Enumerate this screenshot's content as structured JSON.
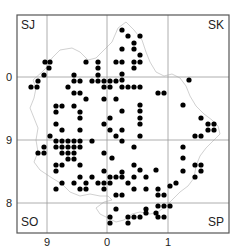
{
  "map": {
    "frame": {
      "x0": 17,
      "y0": 15,
      "x1": 229,
      "y1": 233
    },
    "colors": {
      "frame": "#555555",
      "grid": "#999999",
      "boundary": "#cccccc",
      "dot": "#000000"
    },
    "grid": {
      "vertical": [
        47,
        107,
        168
      ],
      "horizontal": [
        77,
        140,
        203
      ]
    },
    "corner_labels": {
      "top_left": "SJ",
      "top_right": "SK",
      "bottom_left": "SO",
      "bottom_right": "SP"
    },
    "y_ticks": [
      {
        "label": "0",
        "y": 77
      },
      {
        "label": "9",
        "y": 140
      },
      {
        "label": "8",
        "y": 203
      }
    ],
    "x_ticks": [
      {
        "label": "9",
        "x": 47
      },
      {
        "label": "0",
        "x": 107
      },
      {
        "label": "1",
        "x": 168
      }
    ],
    "dot_radius": 2.6,
    "dots": [
      [
        122,
        30
      ],
      [
        128,
        36
      ],
      [
        140,
        36
      ],
      [
        134,
        43
      ],
      [
        122,
        49
      ],
      [
        134,
        49
      ],
      [
        140,
        55
      ],
      [
        45,
        62
      ],
      [
        50,
        62
      ],
      [
        86,
        62
      ],
      [
        98,
        62
      ],
      [
        116,
        62
      ],
      [
        122,
        62
      ],
      [
        134,
        62
      ],
      [
        140,
        62
      ],
      [
        49,
        68
      ],
      [
        98,
        68
      ],
      [
        134,
        68
      ],
      [
        44,
        75
      ],
      [
        74,
        75
      ],
      [
        98,
        75
      ],
      [
        122,
        74
      ],
      [
        38,
        81
      ],
      [
        74,
        81
      ],
      [
        80,
        81
      ],
      [
        92,
        81
      ],
      [
        98,
        81
      ],
      [
        104,
        81
      ],
      [
        110,
        81
      ],
      [
        116,
        81
      ],
      [
        122,
        80
      ],
      [
        31,
        87
      ],
      [
        37,
        87
      ],
      [
        68,
        87
      ],
      [
        104,
        87
      ],
      [
        110,
        87
      ],
      [
        122,
        87
      ],
      [
        128,
        87
      ],
      [
        134,
        87
      ],
      [
        140,
        87
      ],
      [
        74,
        93
      ],
      [
        80,
        93
      ],
      [
        158,
        93
      ],
      [
        164,
        93
      ],
      [
        189,
        80
      ],
      [
        86,
        99
      ],
      [
        104,
        99
      ],
      [
        116,
        99
      ],
      [
        56,
        106
      ],
      [
        62,
        106
      ],
      [
        74,
        106
      ],
      [
        140,
        105
      ],
      [
        183,
        105
      ],
      [
        56,
        112
      ],
      [
        80,
        112
      ],
      [
        122,
        111
      ],
      [
        140,
        111
      ],
      [
        80,
        118
      ],
      [
        110,
        118
      ],
      [
        140,
        118
      ],
      [
        201,
        118
      ],
      [
        56,
        124
      ],
      [
        104,
        124
      ],
      [
        140,
        124
      ],
      [
        208,
        124
      ],
      [
        214,
        124
      ],
      [
        62,
        130
      ],
      [
        80,
        130
      ],
      [
        110,
        130
      ],
      [
        122,
        130
      ],
      [
        208,
        130
      ],
      [
        214,
        130
      ],
      [
        50,
        136
      ],
      [
        116,
        136
      ],
      [
        140,
        136
      ],
      [
        195,
        136
      ],
      [
        201,
        136
      ],
      [
        56,
        141
      ],
      [
        62,
        141
      ],
      [
        68,
        141
      ],
      [
        74,
        141
      ],
      [
        80,
        141
      ],
      [
        92,
        141
      ],
      [
        122,
        141
      ],
      [
        44,
        147
      ],
      [
        56,
        147
      ],
      [
        62,
        147
      ],
      [
        68,
        147
      ],
      [
        74,
        147
      ],
      [
        80,
        147
      ],
      [
        134,
        147
      ],
      [
        183,
        147
      ],
      [
        38,
        153
      ],
      [
        44,
        153
      ],
      [
        62,
        153
      ],
      [
        68,
        153
      ],
      [
        74,
        153
      ],
      [
        104,
        153
      ],
      [
        68,
        159
      ],
      [
        74,
        159
      ],
      [
        112,
        158
      ],
      [
        183,
        158
      ],
      [
        56,
        165
      ],
      [
        62,
        165
      ],
      [
        80,
        165
      ],
      [
        134,
        165
      ],
      [
        195,
        165
      ],
      [
        201,
        165
      ],
      [
        56,
        171
      ],
      [
        104,
        171
      ],
      [
        140,
        170
      ],
      [
        156,
        170
      ],
      [
        122,
        172
      ],
      [
        183,
        171
      ],
      [
        201,
        171
      ],
      [
        80,
        177
      ],
      [
        92,
        177
      ],
      [
        110,
        177
      ],
      [
        116,
        177
      ],
      [
        122,
        177
      ],
      [
        134,
        177
      ],
      [
        146,
        177
      ],
      [
        195,
        177
      ],
      [
        62,
        183
      ],
      [
        74,
        183
      ],
      [
        86,
        183
      ],
      [
        98,
        183
      ],
      [
        104,
        183
      ],
      [
        110,
        183
      ],
      [
        128,
        183
      ],
      [
        176,
        183
      ],
      [
        56,
        189
      ],
      [
        80,
        189
      ],
      [
        86,
        189
      ],
      [
        104,
        189
      ],
      [
        134,
        189
      ],
      [
        146,
        189
      ],
      [
        158,
        189
      ],
      [
        170,
        186
      ],
      [
        116,
        195
      ],
      [
        122,
        195
      ],
      [
        158,
        195
      ],
      [
        164,
        195
      ],
      [
        116,
        209
      ],
      [
        146,
        209
      ],
      [
        158,
        206
      ],
      [
        164,
        206
      ],
      [
        170,
        206
      ],
      [
        110,
        217
      ],
      [
        128,
        217
      ],
      [
        134,
        217
      ],
      [
        140,
        217
      ],
      [
        146,
        213
      ],
      [
        156,
        213
      ],
      [
        158,
        217
      ],
      [
        164,
        217
      ],
      [
        110,
        223
      ],
      [
        128,
        223
      ]
    ],
    "boundary_path": "M36,88 L33,80 L42,72 L46,68 L52,58 L60,50 L72,48 L80,52 L88,60 L96,58 L104,50 L112,42 L118,28 L126,22 L134,30 L142,40 L146,52 L150,62 L156,72 L164,76 L172,74 L180,78 L186,86 L190,96 L196,106 L204,114 L212,120 L218,126 L220,134 L214,140 L206,148 L200,156 L196,166 L194,178 L188,186 L180,192 L172,200 L166,206 L158,212 L150,214 L140,212 L132,214 L124,220 L116,222 L108,218 L100,214 L96,208 L104,202 L112,200 L108,196 L100,196 L90,194 L80,196 L70,192 L62,184 L52,178 L40,170 L34,162 L38,152 L36,140 L38,128 L34,118 L30,108 L34,98 Z"
  }
}
